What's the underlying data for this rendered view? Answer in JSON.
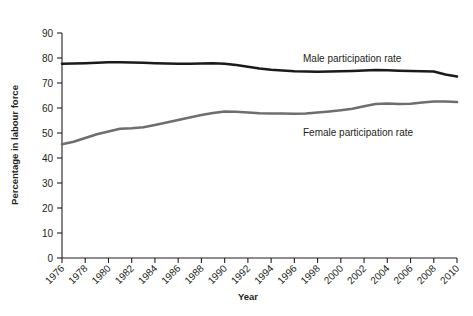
{
  "chart_data": {
    "type": "line",
    "title": "",
    "xlabel": "Year",
    "ylabel": "Percentage in labour force",
    "xlim": [
      1976,
      2010
    ],
    "ylim": [
      0,
      90
    ],
    "grid": false,
    "legend_position": "inline-annotations",
    "x": [
      1976,
      1977,
      1978,
      1979,
      1980,
      1981,
      1982,
      1983,
      1984,
      1985,
      1986,
      1987,
      1988,
      1989,
      1990,
      1991,
      1992,
      1993,
      1994,
      1995,
      1996,
      1997,
      1998,
      1999,
      2000,
      2001,
      2002,
      2003,
      2004,
      2005,
      2006,
      2007,
      2008,
      2009,
      2010
    ],
    "xticks": [
      1976,
      1978,
      1980,
      1982,
      1984,
      1986,
      1988,
      1990,
      1992,
      1994,
      1996,
      1998,
      2000,
      2002,
      2004,
      2006,
      2008,
      2010
    ],
    "xticklabels": [
      "1976",
      "1978",
      "1980",
      "1982",
      "1984",
      "1986",
      "1988",
      "1990",
      "1992",
      "1994",
      "1996",
      "1998",
      "2000",
      "2002",
      "2004",
      "2006",
      "2008",
      "2010"
    ],
    "yticks": [
      0,
      10,
      20,
      30,
      40,
      50,
      60,
      70,
      80,
      90
    ],
    "yticklabels": [
      "0",
      "10",
      "20",
      "30",
      "40",
      "50",
      "60",
      "70",
      "80",
      "90"
    ],
    "series": [
      {
        "name": "Male participation rate",
        "color": "#1a1a1a",
        "annotation": "Male participation rate",
        "values": [
          77.7,
          77.8,
          77.9,
          78.1,
          78.3,
          78.3,
          78.2,
          78.1,
          77.9,
          77.8,
          77.7,
          77.7,
          77.8,
          77.9,
          77.7,
          77.2,
          76.5,
          75.8,
          75.3,
          75.0,
          74.7,
          74.6,
          74.5,
          74.6,
          74.7,
          74.8,
          75.0,
          75.2,
          75.1,
          74.9,
          74.8,
          74.7,
          74.6,
          73.4,
          72.6
        ]
      },
      {
        "name": "Female participation rate",
        "color": "#6e6e6e",
        "annotation": "Female participation rate",
        "values": [
          45.5,
          46.5,
          48.0,
          49.5,
          50.6,
          51.7,
          51.9,
          52.3,
          53.2,
          54.2,
          55.2,
          56.2,
          57.2,
          58.0,
          58.6,
          58.5,
          58.2,
          57.9,
          57.8,
          57.8,
          57.7,
          57.8,
          58.2,
          58.6,
          59.1,
          59.7,
          60.7,
          61.6,
          61.8,
          61.6,
          61.7,
          62.2,
          62.6,
          62.6,
          62.4
        ]
      }
    ]
  },
  "annotations": {
    "male_label": "Male participation rate",
    "female_label": "Female participation rate"
  },
  "axis": {
    "x_title": "Year",
    "y_title": "Percentage in labour force"
  }
}
